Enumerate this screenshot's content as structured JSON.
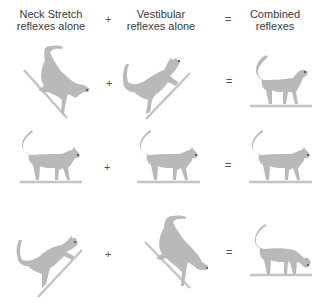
{
  "headers": {
    "col1": {
      "line1": "Neck Stretch",
      "line2": "reflexes alone"
    },
    "col2": {
      "line1": "Vestibular",
      "line2": "reflexes alone"
    },
    "col3": {
      "line1": "Combined",
      "line2": "reflexes"
    }
  },
  "operators": {
    "plus": "+",
    "equals": "="
  },
  "colors": {
    "cat": "#b9b9b9",
    "cat_outline": "#a6a6a6",
    "ground": "#c4c4c4",
    "eye": "#333333"
  },
  "rows": [
    {
      "name": "head-down-tilt",
      "col1": "cat on descending slope",
      "col2": "cat on ascending slope",
      "col3": "cat standing level, head raised"
    },
    {
      "name": "level",
      "col1": "cat standing level",
      "col2": "cat standing level",
      "col3": "cat standing level"
    },
    {
      "name": "head-up-tilt",
      "col1": "cat on ascending slope",
      "col2": "cat on descending slope",
      "col3": "cat standing level, head lowered"
    }
  ]
}
